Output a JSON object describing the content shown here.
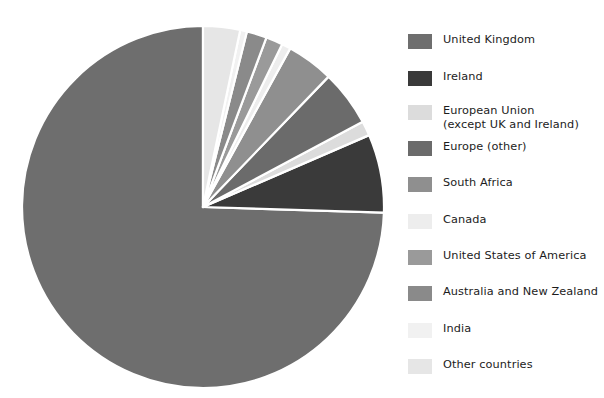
{
  "chart_data": {
    "type": "pie",
    "title": "",
    "subtitle": "",
    "xlabel": "",
    "ylabel": "",
    "legend_position": "right",
    "grid": false,
    "start_angle_deg": 90,
    "direction": "counterclockwise",
    "categories": [
      "United Kingdom",
      "Ireland",
      "European Union (except UK and Ireland)",
      "Europe (other)",
      "South Africa",
      "Canada",
      "United States of America",
      "Australia and New Zealand",
      "India",
      "Other countries"
    ],
    "values": [
      74.5,
      7.0,
      1.3,
      5.0,
      4.2,
      0.8,
      1.5,
      1.8,
      0.6,
      3.3
    ],
    "colors": [
      "#6e6e6e",
      "#3a3a3a",
      "#dcdcdc",
      "#6b6b6b",
      "#8f8f8f",
      "#ededed",
      "#9a9a9a",
      "#8a8a8a",
      "#f1f1f1",
      "#e6e6e6"
    ]
  },
  "pie": {
    "center_x": 203,
    "center_y": 207,
    "radius": 181,
    "wedge_gap_color": "#ffffff"
  },
  "legend": {
    "items": [
      {
        "label": "United Kingdom",
        "color": "#6e6e6e",
        "swatch_name": "legend-swatch-united-kingdom",
        "y": 17
      },
      {
        "label": "Ireland",
        "color": "#3a3a3a",
        "swatch_name": "legend-swatch-ireland",
        "y": 54
      },
      {
        "label": "European Union\n(except UK and Ireland)",
        "color": "#dcdcdc",
        "swatch_name": "legend-swatch-european-union",
        "y": 88
      },
      {
        "label": "Europe (other)",
        "color": "#6b6b6b",
        "swatch_name": "legend-swatch-europe-other",
        "y": 124
      },
      {
        "label": "South Africa",
        "color": "#8f8f8f",
        "swatch_name": "legend-swatch-south-africa",
        "y": 160
      },
      {
        "label": "Canada",
        "color": "#ededed",
        "swatch_name": "legend-swatch-canada",
        "y": 197
      },
      {
        "label": "United States of America",
        "color": "#9a9a9a",
        "swatch_name": "legend-swatch-united-states-of-america",
        "y": 233
      },
      {
        "label": "Australia and New Zealand",
        "color": "#8a8a8a",
        "swatch_name": "legend-swatch-australia-and-new-zealand",
        "y": 269
      },
      {
        "label": "India",
        "color": "#f1f1f1",
        "swatch_name": "legend-swatch-india",
        "y": 306
      },
      {
        "label": "Other countries",
        "color": "#e6e6e6",
        "swatch_name": "legend-swatch-other-countries",
        "y": 342
      }
    ]
  }
}
